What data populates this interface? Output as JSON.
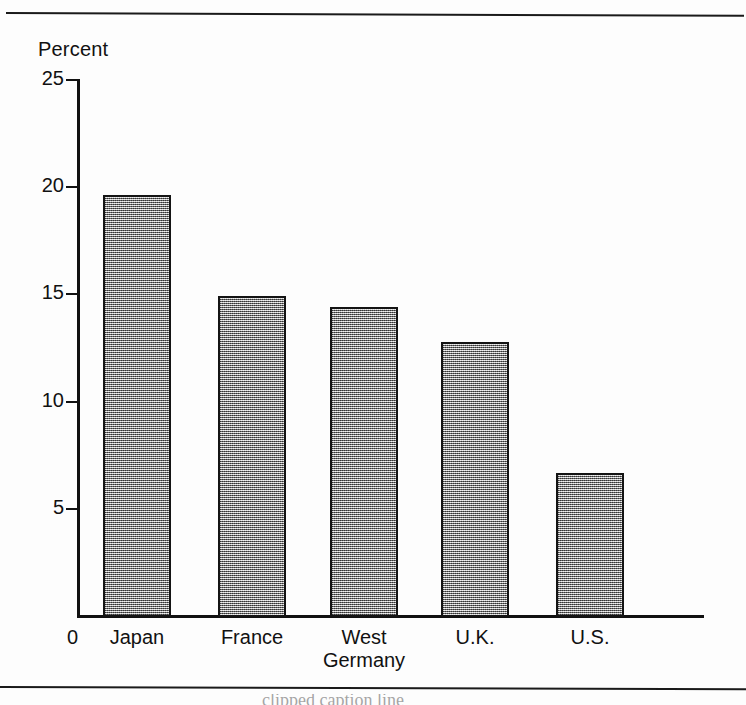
{
  "chart_data": {
    "type": "bar",
    "title": "",
    "subtitle": "",
    "xlabel": "",
    "ylabel": "Percent",
    "ylim": [
      0,
      25
    ],
    "yticks": [
      0,
      5,
      10,
      15,
      20,
      25
    ],
    "ytick_labels": [
      "0",
      "5",
      "10",
      "15",
      "20",
      "25"
    ],
    "categories": [
      "Japan",
      "France",
      "West Germany",
      "U.K.",
      "U.S."
    ],
    "category_label_lines": [
      [
        "Japan"
      ],
      [
        "France"
      ],
      [
        "West",
        "Germany"
      ],
      [
        "U.K."
      ],
      [
        "U.S."
      ]
    ],
    "values": [
      19.6,
      14.9,
      14.4,
      12.8,
      6.7
    ],
    "grid": false,
    "legend": null,
    "bar_fill": "#9a9a9a",
    "bar_edge": "#141414",
    "axis_color": "#111111",
    "background": "#fdfdfd"
  },
  "axis": {
    "y_title": "Percent",
    "zero_label": "0"
  },
  "caption": {
    "text": "clipped caption line"
  }
}
